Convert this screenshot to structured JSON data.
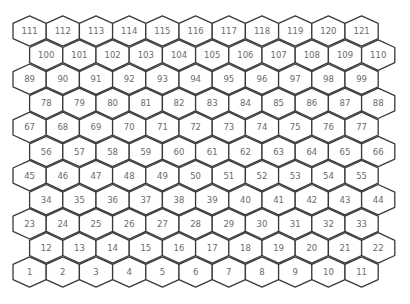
{
  "grid": {
    "orientation": "pointy-top",
    "rows": 11,
    "cols": 11,
    "numbering": "bottom-left start, left-to-right, row by row upward",
    "colors": {
      "stroke": "#3a3a3a",
      "fill": "#ffffff",
      "label": "#6a6a6a",
      "background": "#ffffff"
    },
    "layout_rows": [
      {
        "row_from_top": 0,
        "offset": false,
        "labels": [
          111,
          112,
          113,
          114,
          115,
          116,
          117,
          118,
          119,
          120,
          121
        ]
      },
      {
        "row_from_top": 1,
        "offset": true,
        "labels": [
          100,
          101,
          102,
          103,
          104,
          105,
          106,
          107,
          108,
          109,
          110
        ]
      },
      {
        "row_from_top": 2,
        "offset": false,
        "labels": [
          89,
          90,
          91,
          92,
          93,
          94,
          95,
          96,
          97,
          98,
          99
        ]
      },
      {
        "row_from_top": 3,
        "offset": true,
        "labels": [
          78,
          79,
          80,
          81,
          82,
          83,
          84,
          85,
          86,
          87,
          88
        ]
      },
      {
        "row_from_top": 4,
        "offset": false,
        "labels": [
          67,
          68,
          69,
          70,
          71,
          72,
          73,
          74,
          75,
          76,
          77
        ]
      },
      {
        "row_from_top": 5,
        "offset": true,
        "labels": [
          56,
          57,
          58,
          59,
          60,
          61,
          62,
          63,
          64,
          65,
          66
        ]
      },
      {
        "row_from_top": 6,
        "offset": false,
        "labels": [
          45,
          46,
          47,
          48,
          49,
          50,
          51,
          52,
          53,
          54,
          55
        ]
      },
      {
        "row_from_top": 7,
        "offset": true,
        "labels": [
          34,
          35,
          36,
          37,
          38,
          39,
          40,
          41,
          42,
          43,
          44
        ]
      },
      {
        "row_from_top": 8,
        "offset": false,
        "labels": [
          23,
          24,
          25,
          26,
          27,
          28,
          29,
          30,
          31,
          32,
          33
        ]
      },
      {
        "row_from_top": 9,
        "offset": true,
        "labels": [
          12,
          13,
          14,
          15,
          16,
          17,
          18,
          19,
          20,
          21,
          22
        ]
      },
      {
        "row_from_top": 10,
        "offset": false,
        "labels": [
          1,
          2,
          3,
          4,
          5,
          6,
          7,
          8,
          9,
          10,
          11
        ]
      }
    ]
  }
}
